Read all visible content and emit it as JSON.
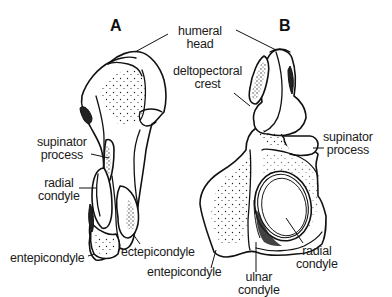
{
  "figure": {
    "panels": [
      {
        "id": "A",
        "label": "A",
        "annotations": {
          "supinator_process": [
            "supinator",
            "process"
          ],
          "radial_condyle": [
            "radial",
            "condyle"
          ],
          "entepicondyle": "entepicondyle",
          "ectepicondyle": "ectepicondyle"
        }
      },
      {
        "id": "B",
        "label": "B",
        "annotations": {
          "deltopectoral_crest": [
            "deltopectoral",
            "crest"
          ],
          "supinator_process": [
            "supinator",
            "process"
          ],
          "entepicondyle": "entepicondyle",
          "ulnar_condyle": [
            "ulnar",
            "condyle"
          ],
          "radial_condyle": [
            "radial",
            "condyle"
          ]
        }
      }
    ],
    "shared": {
      "humeral_head": [
        "humeral",
        "head"
      ]
    }
  }
}
